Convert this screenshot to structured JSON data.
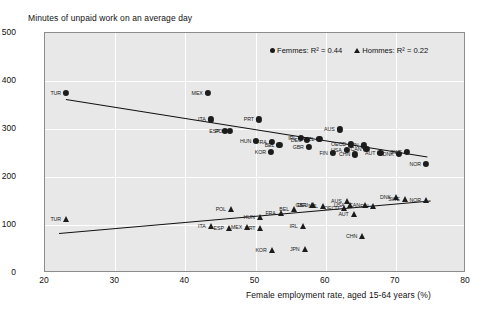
{
  "chart_data": {
    "type": "scatter",
    "title": "Minutes of unpaid work on an average day",
    "xlabel": "Female employment rate, aged 15-64 years (%)",
    "ylabel": "",
    "xlim": [
      20,
      80
    ],
    "ylim": [
      0,
      500
    ],
    "xticks": [
      20,
      30,
      40,
      50,
      60,
      70,
      80
    ],
    "yticks": [
      0,
      100,
      200,
      300,
      400,
      500
    ],
    "grid": true,
    "legend_position": "top-right",
    "legend": [
      {
        "name": "Femmes",
        "marker": "circle",
        "r2": 0.44,
        "label": "Femmes: R² = 0.44"
      },
      {
        "name": "Hommes",
        "marker": "triangle",
        "r2": 0.22,
        "label": "Hommes: R² = 0.22"
      }
    ],
    "series": [
      {
        "name": "Femmes",
        "marker": "circle",
        "trendline": {
          "x1": 23.0,
          "y1": 363,
          "x2": 74.5,
          "y2": 243
        },
        "points": [
          {
            "label": "TUR",
            "x": 23.0,
            "y": 375,
            "lpos": "left"
          },
          {
            "label": "MEX",
            "x": 43.2,
            "y": 375,
            "lpos": "left"
          },
          {
            "label": "ITA",
            "x": 43.6,
            "y": 320,
            "lpos": "left"
          },
          {
            "label": "ESP",
            "x": 45.6,
            "y": 296,
            "lpos": "left"
          },
          {
            "label": "POL",
            "x": 46.4,
            "y": 296,
            "lpos": "left"
          },
          {
            "label": "PRT",
            "x": 50.5,
            "y": 320,
            "lpos": "left"
          },
          {
            "label": "HUN",
            "x": 50.1,
            "y": 276,
            "lpos": "left"
          },
          {
            "label": "FRA",
            "x": 52.3,
            "y": 273,
            "lpos": "left"
          },
          {
            "label": "BEL",
            "x": 53.4,
            "y": 267,
            "lpos": "left"
          },
          {
            "label": "KOR",
            "x": 52.2,
            "y": 253,
            "lpos": "left"
          },
          {
            "label": "IRL",
            "x": 56.5,
            "y": 281,
            "lpos": "left"
          },
          {
            "label": "DEU",
            "x": 57.3,
            "y": 277,
            "lpos": "left"
          },
          {
            "label": "NZL",
            "x": 59.1,
            "y": 280,
            "lpos": "left"
          },
          {
            "label": "GBR",
            "x": 57.6,
            "y": 263,
            "lpos": "left"
          },
          {
            "label": "AUS",
            "x": 62.0,
            "y": 299,
            "lpos": "left"
          },
          {
            "label": "OECD",
            "x": 63.6,
            "y": 268,
            "lpos": "left"
          },
          {
            "label": "USA",
            "x": 63.0,
            "y": 256,
            "lpos": "left"
          },
          {
            "label": "JPN",
            "x": 65.4,
            "y": 266,
            "lpos": "left"
          },
          {
            "label": "CAN",
            "x": 65.8,
            "y": 258,
            "lpos": "left"
          },
          {
            "label": "FIN",
            "x": 61.0,
            "y": 250,
            "lpos": "left"
          },
          {
            "label": "CHN",
            "x": 64.2,
            "y": 247,
            "lpos": "left"
          },
          {
            "label": "AUT",
            "x": 67.8,
            "y": 251,
            "lpos": "left"
          },
          {
            "label": "SWE",
            "x": 71.6,
            "y": 252,
            "lpos": "left"
          },
          {
            "label": "DNK",
            "x": 70.4,
            "y": 248,
            "lpos": "left"
          },
          {
            "label": "NOR",
            "x": 74.3,
            "y": 228,
            "lpos": "left"
          }
        ]
      },
      {
        "name": "Hommes",
        "marker": "triangle",
        "trendline": {
          "x1": 22.0,
          "y1": 84,
          "x2": 75.0,
          "y2": 152
        },
        "points": [
          {
            "label": "TUR",
            "x": 23.0,
            "y": 112,
            "lpos": "left"
          },
          {
            "label": "ITA",
            "x": 43.6,
            "y": 97,
            "lpos": "left"
          },
          {
            "label": "ESP",
            "x": 46.2,
            "y": 94,
            "lpos": "left"
          },
          {
            "label": "POL",
            "x": 46.5,
            "y": 134,
            "lpos": "left"
          },
          {
            "label": "MEX",
            "x": 48.8,
            "y": 95,
            "lpos": "left"
          },
          {
            "label": "HUN",
            "x": 50.6,
            "y": 116,
            "lpos": "left"
          },
          {
            "label": "PRT",
            "x": 50.7,
            "y": 93,
            "lpos": "left"
          },
          {
            "label": "FRA",
            "x": 53.6,
            "y": 126,
            "lpos": "left"
          },
          {
            "label": "BEL",
            "x": 55.5,
            "y": 134,
            "lpos": "left"
          },
          {
            "label": "KOR",
            "x": 52.3,
            "y": 48,
            "lpos": "left"
          },
          {
            "label": "IRL",
            "x": 56.7,
            "y": 98,
            "lpos": "left"
          },
          {
            "label": "DEU",
            "x": 58.2,
            "y": 142,
            "lpos": "left"
          },
          {
            "label": "GBR",
            "x": 58.0,
            "y": 141,
            "lpos": "left"
          },
          {
            "label": "NZL",
            "x": 59.6,
            "y": 139,
            "lpos": "left"
          },
          {
            "label": "OECD",
            "x": 62.6,
            "y": 135,
            "lpos": "left"
          },
          {
            "label": "AUS",
            "x": 63.0,
            "y": 150,
            "lpos": "left"
          },
          {
            "label": "USA",
            "x": 63.4,
            "y": 141,
            "lpos": "left"
          },
          {
            "label": "AUT",
            "x": 64.0,
            "y": 123,
            "lpos": "left"
          },
          {
            "label": "CAN",
            "x": 65.6,
            "y": 141,
            "lpos": "left"
          },
          {
            "label": "FIN",
            "x": 66.8,
            "y": 139,
            "lpos": "left"
          },
          {
            "label": "DNK",
            "x": 70.0,
            "y": 159,
            "lpos": "left"
          },
          {
            "label": "SWE",
            "x": 71.3,
            "y": 154,
            "lpos": "left"
          },
          {
            "label": "NOR",
            "x": 74.3,
            "y": 152,
            "lpos": "left"
          },
          {
            "label": "CHN",
            "x": 65.2,
            "y": 78,
            "lpos": "left"
          },
          {
            "label": "JPN",
            "x": 57.0,
            "y": 50,
            "lpos": "left"
          }
        ]
      }
    ]
  }
}
